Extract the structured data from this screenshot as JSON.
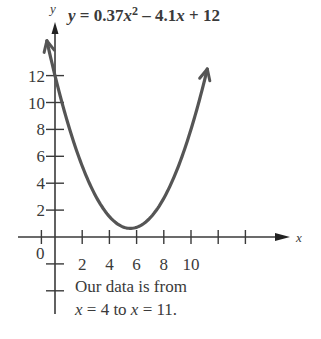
{
  "chart_data": {
    "type": "line",
    "title_parts": {
      "lhs": "y",
      "eq": " = 0.37",
      "x1": "x",
      "sup": "2",
      "mid": " – 4.1",
      "x2": "x",
      "end": " + 12"
    },
    "equation": {
      "a": 0.37,
      "b": -4.1,
      "c": 12
    },
    "xlabel": "x",
    "ylabel": "y",
    "xlim": [
      -1,
      17
    ],
    "ylim": [
      -6,
      15
    ],
    "x_ticks": [
      -1,
      2,
      4,
      6,
      8,
      10,
      12,
      14
    ],
    "x_tick_labels": [
      "2",
      "4",
      "6",
      "8",
      "10"
    ],
    "y_ticks": [
      2,
      4,
      6,
      8,
      10,
      12,
      -2,
      -4
    ],
    "y_tick_labels": [
      "2",
      "4",
      "6",
      "8",
      "10",
      "12"
    ],
    "origin_label": "0",
    "curve_x_range": [
      -0.6,
      11.2
    ],
    "vertex": {
      "x": 5.54,
      "y": 0.64
    },
    "grid": false,
    "annotation": {
      "line1": "Our data is from",
      "line2_parts": {
        "x1": "x",
        "a": " = 4 to ",
        "x2": "x",
        "b": " = 11."
      }
    },
    "colors": {
      "curve": "#555555",
      "axis": "#3a3a3a",
      "text": "#3a3a3a"
    }
  }
}
